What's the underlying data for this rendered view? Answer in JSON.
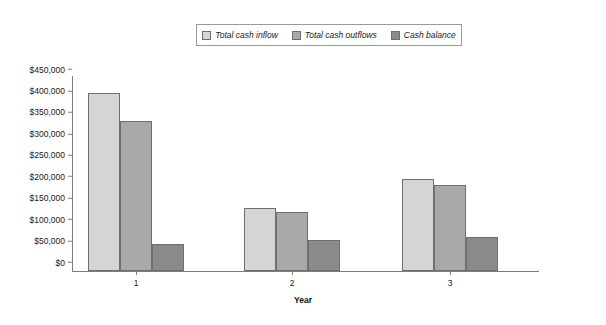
{
  "chart_data": {
    "type": "bar",
    "title": "",
    "xlabel": "Year",
    "ylabel": "",
    "categories": [
      "1",
      "2",
      "3"
    ],
    "series": [
      {
        "name": "Total cash inflow",
        "color": "#d5d5d5",
        "values": [
          415000,
          148000,
          215000
        ]
      },
      {
        "name": "Total cash outflows",
        "color": "#a9a9a9",
        "values": [
          350000,
          138000,
          200000
        ]
      },
      {
        "name": "Cash balance",
        "color": "#8b8b8b",
        "values": [
          62000,
          72000,
          80000
        ]
      }
    ],
    "ylim": [
      0,
      450000
    ],
    "ytick_values": [
      0,
      50000,
      100000,
      150000,
      200000,
      250000,
      300000,
      350000,
      400000,
      450000
    ],
    "ytick_labels": [
      "$0",
      "$50,000",
      "$100,000",
      "$150,000",
      "$200,000",
      "$250,000",
      "$300,000",
      "$350,000",
      "$400,000",
      "$450,000"
    ],
    "grid": false,
    "legend_position": "top-center",
    "background_color": "#ffffff",
    "axis_color": "#7d7d7d"
  }
}
